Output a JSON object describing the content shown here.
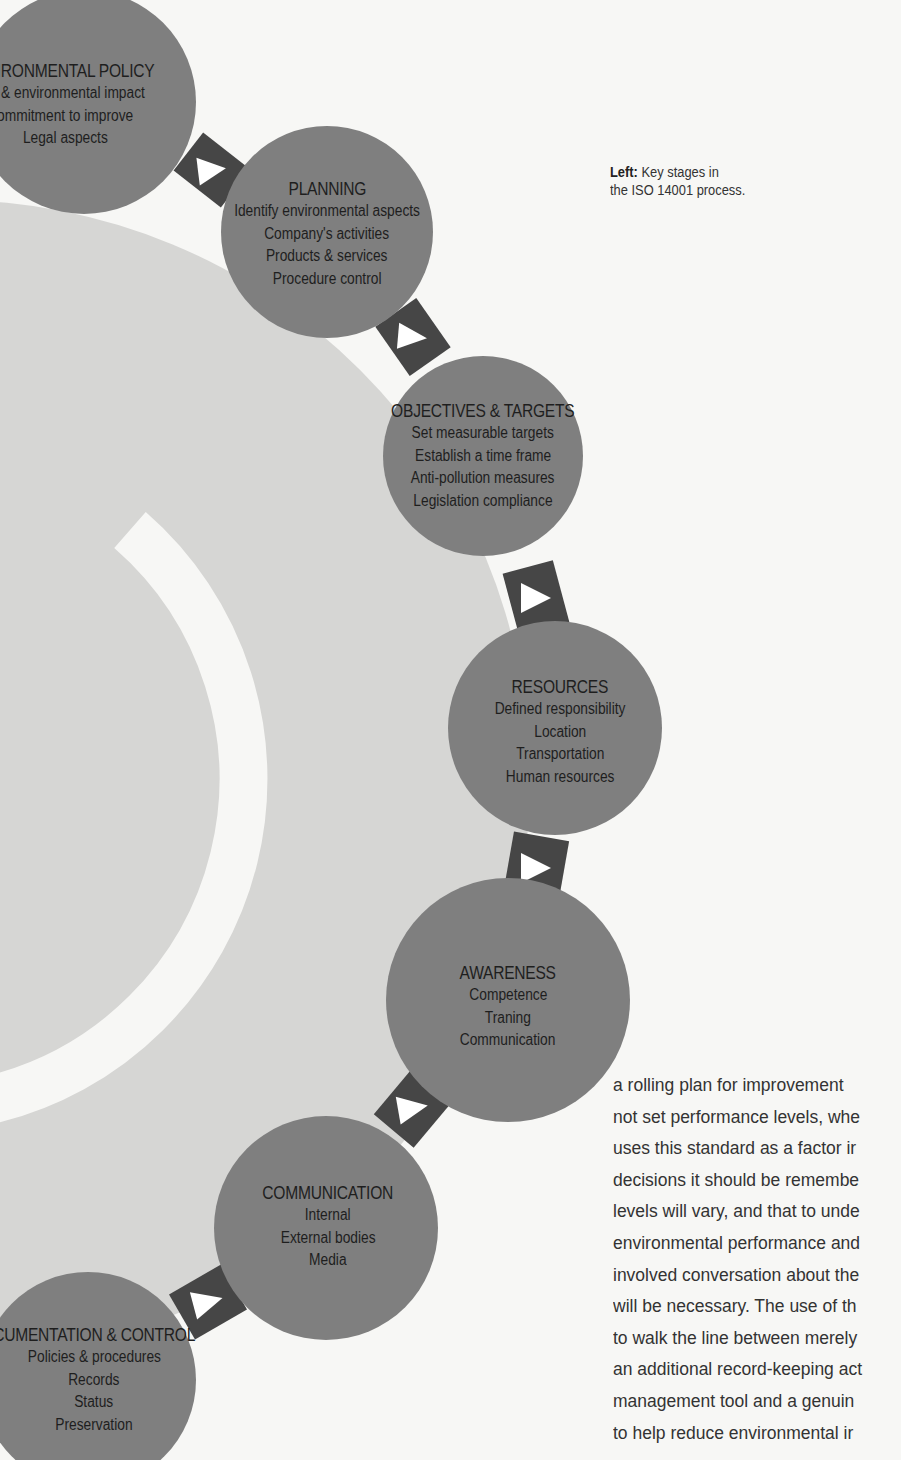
{
  "caption": {
    "label": "Left:",
    "text_line1": "Key stages in",
    "text_line2": "the ISO 14001 process."
  },
  "colors": {
    "background": "#f7f7f5",
    "big_circle": "#d6d6d4",
    "stage_circle": "#7f7f7f",
    "connector": "#464646",
    "arrow": "#ffffff",
    "text": "#1e1e1e"
  },
  "stages": [
    {
      "title": "ENVIRONMENTAL POLICY",
      "visible_title": "NVIRONMENTAL POLICY",
      "items": [
        "re & environmental impact",
        "ommitment to improve",
        "Legal aspects"
      ]
    },
    {
      "title": "PLANNING",
      "items": [
        "Identify environmental aspects",
        "Company's activities",
        "Products & services",
        "Procedure control"
      ]
    },
    {
      "title": "OBJECTIVES & TARGETS",
      "items": [
        "Set measurable targets",
        "Establish a time frame",
        "Anti-pollution measures",
        "Legislation compliance"
      ]
    },
    {
      "title": "RESOURCES",
      "items": [
        "Defined responsibility",
        "Location",
        "Transportation",
        "Human resources"
      ]
    },
    {
      "title": "AWARENESS",
      "items": [
        "Competence",
        "Traning",
        "Communication"
      ]
    },
    {
      "title": "COMMUNICATION",
      "items": [
        "Internal",
        "External bodies",
        "Media"
      ]
    },
    {
      "title": "DOCUMENTATION & CONTROL",
      "visible_title": "CUMENTATION & CONTROL",
      "items": [
        "Policies & procedures",
        "Records",
        "Status",
        "Preservation"
      ]
    }
  ],
  "body_text": {
    "lines": [
      "a rolling plan for improvement",
      "not set performance levels, whe",
      "uses this standard as a factor ir",
      "decisions it should be remembe",
      "levels will vary, and that to unde",
      "environmental performance and",
      "involved conversation about the",
      "will be necessary. The use of th",
      "to walk the line between merely",
      "an additional record-keeping act",
      "management tool and a genuin",
      "to help reduce environmental ir"
    ]
  }
}
